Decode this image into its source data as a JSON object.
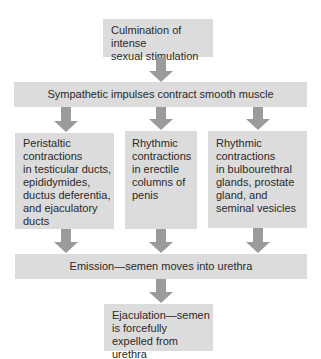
{
  "diagram": {
    "type": "flowchart",
    "top_box": {
      "lines": [
        "Culmination of intense",
        "sexual stimulation"
      ]
    },
    "sympathetic_bar": {
      "label": "Sympathetic impulses contract smooth muscle"
    },
    "columns": [
      {
        "lines": [
          "Peristaltic",
          "contractions",
          "in testicular ducts,",
          "epididymides,",
          "ductus deferentia,",
          "and ejaculatory",
          "ducts"
        ]
      },
      {
        "lines": [
          "Rhythmic",
          "contractions",
          "in erectile",
          "columns of",
          "penis"
        ]
      },
      {
        "lines": [
          "Rhythmic",
          "contractions",
          "in bulbourethral",
          "glands, prostate",
          "gland, and",
          "seminal vesicles"
        ]
      }
    ],
    "emission_bar": {
      "label": "Emission—semen moves into urethra"
    },
    "bottom_box": {
      "lines": [
        "Ejaculation—semen",
        "is forcefully",
        "expelled from urethra"
      ]
    },
    "colors": {
      "box": "#dcdcdc",
      "arrow": "#9b9b9b",
      "text": "#2a2a2a"
    }
  }
}
